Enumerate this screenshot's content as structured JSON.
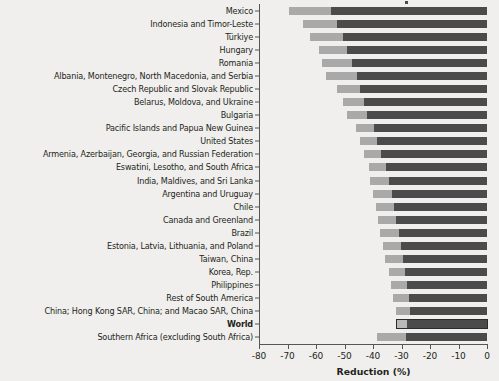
{
  "chart_data": {
    "type": "bar",
    "orientation": "horizontal",
    "stacked": true,
    "title": "",
    "xlabel": "Reduction (%)",
    "ylabel": "",
    "xlim": [
      -80,
      0
    ],
    "xticks": [
      -80,
      -70,
      -60,
      -50,
      -40,
      -30,
      -20,
      -10,
      0
    ],
    "xtick_labels": [
      "-80",
      "-70",
      "-60",
      "-50",
      "-40",
      "-30",
      "-20",
      "-10",
      "0"
    ],
    "grid": false,
    "legend_position": "top-right-cropped",
    "categories": [
      "Mexico",
      "Indonesia and Timor-Leste",
      "Türkiye",
      "Hungary",
      "Romania",
      "Albania, Montenegro, North Macedonia, and Serbia",
      "Czech Republic and Slovak Republic",
      "Belarus, Moldova, and Ukraine",
      "Bulgaria",
      "Pacific Islands and Papua New Guinea",
      "United States",
      "Armenia, Azerbaijan, Georgia, and Russian Federation",
      "Eswatini, Lesotho, and South Africa",
      "India, Maldives, and Sri Lanka",
      "Argentina and Uruguay",
      "Chile",
      "Canada and Greenland",
      "Brazil",
      "Estonia, Latvia, Lithuania, and Poland",
      "Taiwan, China",
      "Korea, Rep.",
      "Philippines",
      "Rest of South America",
      "China; Hong Kong SAR, China; and Macao SAR, China",
      "World",
      "Southern Africa (excluding South Africa)"
    ],
    "highlight_category": "World",
    "series": [
      {
        "name": "first-segment",
        "color": "#a9a9a9",
        "start": [
          -69.5,
          -64.5,
          -62.2,
          -59.0,
          -58.0,
          -56.5,
          -52.5,
          -50.5,
          -49.0,
          -46.0,
          -44.5,
          -43.2,
          -41.5,
          -41.0,
          -40.0,
          -39.0,
          -38.3,
          -37.5,
          -36.5,
          -35.8,
          -34.5,
          -33.8,
          -33.0,
          -32.0,
          -31.5,
          -38.5
        ],
        "end": [
          -54.8,
          -52.5,
          -50.5,
          -49.0,
          -47.5,
          -45.5,
          -44.5,
          -43.0,
          -42.0,
          -39.5,
          -38.5,
          -37.2,
          -35.5,
          -34.5,
          -33.5,
          -32.5,
          -31.8,
          -31.0,
          -30.0,
          -29.5,
          -28.8,
          -28.2,
          -27.2,
          -27.0,
          -28.0,
          -28.5
        ]
      },
      {
        "name": "second-segment",
        "color": "#4b4b4b",
        "start": [
          -54.8,
          -52.5,
          -50.5,
          -49.0,
          -47.5,
          -45.5,
          -44.5,
          -43.0,
          -42.0,
          -39.5,
          -38.5,
          -37.2,
          -35.5,
          -34.5,
          -33.5,
          -32.5,
          -31.8,
          -31.0,
          -30.0,
          -29.5,
          -28.8,
          -28.2,
          -27.2,
          -27.0,
          -28.0,
          -28.5
        ],
        "end": [
          0,
          0,
          0,
          0,
          0,
          0,
          0,
          0,
          0,
          0,
          0,
          0,
          0,
          0,
          0,
          0,
          0,
          0,
          0,
          0,
          0,
          0,
          0,
          0,
          0,
          0
        ]
      }
    ]
  }
}
